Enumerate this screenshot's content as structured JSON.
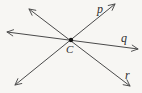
{
  "figure": {
    "labels": {
      "point": "C",
      "line_p": "p",
      "line_q": "q",
      "line_r": "r"
    },
    "colors": {
      "background": "#f7f6f3",
      "line": "#4a4a4a",
      "point": "#151515",
      "label": "#2e2e2e"
    }
  }
}
